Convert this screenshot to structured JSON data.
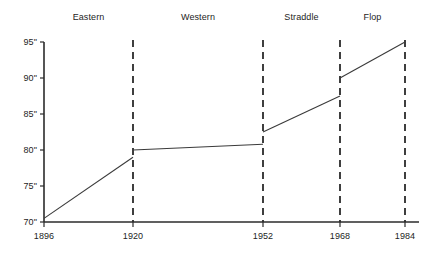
{
  "chart_data": {
    "type": "line",
    "title": "",
    "subtitle": "",
    "xlabel": "",
    "ylabel": "",
    "xlim": [
      1896,
      1984
    ],
    "ylim": [
      70,
      95
    ],
    "grid": false,
    "legend_position": "none",
    "y_tick_labels": [
      "95\"",
      "90\"",
      "85\"",
      "80\"",
      "75\"",
      "70\""
    ],
    "y_ticks": [
      95,
      90,
      85,
      80,
      75,
      70
    ],
    "x_tick_labels": [
      "1896",
      "1920",
      "1952",
      "1968",
      "1984"
    ],
    "x_ticks": [
      1896,
      1920,
      1952,
      1968,
      1984
    ],
    "era_annotations": [
      {
        "label": "Eastern",
        "start": 1896,
        "end": 1920
      },
      {
        "label": "Western",
        "start": 1920,
        "end": 1952
      },
      {
        "label": "Straddle",
        "start": 1952,
        "end": 1968
      },
      {
        "label": "Flop",
        "start": 1968,
        "end": 1984
      }
    ],
    "divider_years": [
      1920,
      1952,
      1968,
      1984
    ],
    "series": [
      {
        "name": "Eastern",
        "x": [
          1896,
          1920
        ],
        "values": [
          70.5,
          79.0
        ]
      },
      {
        "name": "Western",
        "x": [
          1920,
          1952
        ],
        "values": [
          80.0,
          80.8
        ]
      },
      {
        "name": "Straddle",
        "x": [
          1952,
          1968
        ],
        "values": [
          82.5,
          87.5
        ]
      },
      {
        "name": "Flop",
        "x": [
          1968,
          1984
        ],
        "values": [
          90.0,
          95.0
        ]
      }
    ]
  }
}
